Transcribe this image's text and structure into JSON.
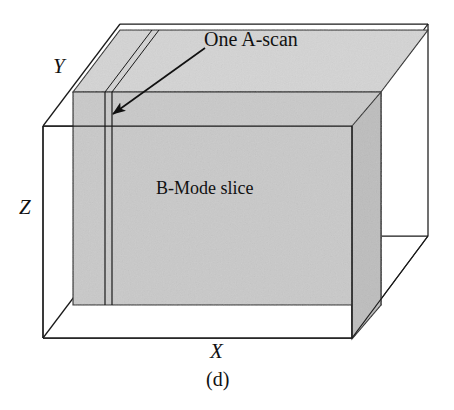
{
  "figure": {
    "caption": "(d)",
    "annotations": {
      "ascan": "One A-scan",
      "bmode": "B-Mode slice"
    },
    "axes": {
      "x": "X",
      "y": "Y",
      "z": "Z"
    },
    "colors": {
      "slice_fill": "#c9c9c9",
      "slice_fill_top": "#d4d4d4",
      "slice_fill_side": "#bdbdbd",
      "stroke": "#1a1a1a",
      "background": "#ffffff"
    },
    "geometry": {
      "type": "isometric-box",
      "description": "Wireframe 3D volume with a shaded B-Mode slice plane and one vertical A-scan line",
      "depth_offset_x": 77,
      "depth_offset_y": -102
    }
  }
}
